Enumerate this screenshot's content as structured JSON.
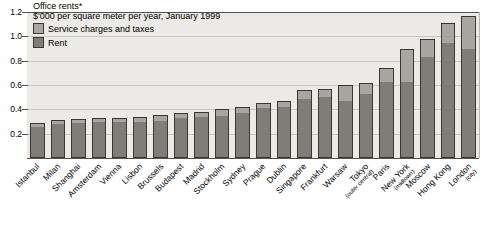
{
  "chart_data": {
    "type": "bar",
    "title": "Office rents*",
    "subtitle": "$'000 per square meter per year, January 1999",
    "xlabel": "",
    "ylabel": "",
    "ylim": [
      0,
      1.2
    ],
    "yticks": [
      "0.2",
      "0.4",
      "0.6",
      "0.8",
      "1.0",
      "1.2"
    ],
    "ytick_values": [
      0.2,
      0.4,
      0.6,
      0.8,
      1.0,
      1.2
    ],
    "grid": true,
    "stacked": true,
    "legend_position": "top-left",
    "legend": [
      {
        "name": "Service charges and taxes",
        "color": "#a9a6a1"
      },
      {
        "name": "Rent",
        "color": "#807d79"
      }
    ],
    "categories": [
      "Istanbul",
      "Milan",
      "Shanghai",
      "Amsterdam",
      "Vienna",
      "Lisbon",
      "Brussels",
      "Budapest",
      "Madrid",
      "Stockholm",
      "Sydney",
      "Prague",
      "Dublin",
      "Singapore",
      "Frankfurt",
      "Warsaw",
      "Tokyo",
      "Paris",
      "New York",
      "Moscow",
      "Hong Kong",
      "London"
    ],
    "category_subnotes": [
      "",
      "",
      "",
      "",
      "",
      "",
      "",
      "",
      "",
      "",
      "",
      "",
      "",
      "",
      "",
      "",
      "(outer central)",
      "",
      "(midtown)",
      "",
      "",
      "(city)"
    ],
    "series": [
      {
        "name": "Rent",
        "color": "#807d79",
        "values": [
          0.25,
          0.27,
          0.28,
          0.29,
          0.29,
          0.29,
          0.3,
          0.32,
          0.33,
          0.34,
          0.36,
          0.4,
          0.41,
          0.48,
          0.49,
          0.46,
          0.52,
          0.62,
          0.62,
          0.82,
          0.94,
          0.89
        ]
      },
      {
        "name": "Service charges and taxes",
        "color": "#a9a6a1",
        "values": [
          0.04,
          0.04,
          0.04,
          0.04,
          0.04,
          0.05,
          0.05,
          0.05,
          0.05,
          0.06,
          0.06,
          0.05,
          0.06,
          0.08,
          0.08,
          0.14,
          0.1,
          0.12,
          0.28,
          0.16,
          0.17,
          0.28
        ]
      }
    ],
    "totals": [
      0.29,
      0.31,
      0.32,
      0.33,
      0.33,
      0.34,
      0.35,
      0.37,
      0.38,
      0.4,
      0.42,
      0.45,
      0.47,
      0.56,
      0.57,
      0.6,
      0.62,
      0.74,
      0.9,
      0.98,
      1.11,
      1.17
    ]
  },
  "footnote": ""
}
